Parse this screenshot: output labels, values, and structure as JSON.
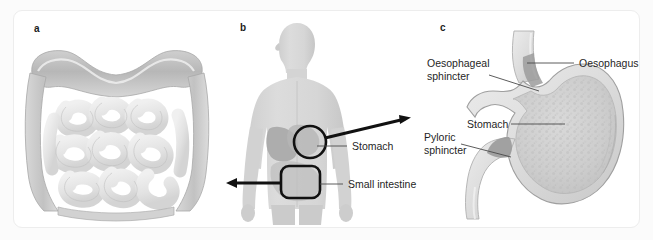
{
  "figure": {
    "panels": [
      {
        "letter": "a",
        "name": "intestines-illustration",
        "subject": "large and small intestine anatomical illustration",
        "labels": []
      },
      {
        "letter": "b",
        "name": "human-body-silhouette",
        "subject": "human body outline with digestive organ callouts",
        "labels": [
          {
            "text": "Stomach",
            "callout": "circle"
          },
          {
            "text": "Small intestine",
            "callout": "rounded-rectangle"
          }
        ]
      },
      {
        "letter": "c",
        "name": "stomach-cross-section",
        "subject": "stomach cross-section with sphincters",
        "labels": [
          {
            "text": "Oesophagus"
          },
          {
            "text": "Oesophageal",
            "text2": "sphincter"
          },
          {
            "text": "Stomach"
          },
          {
            "text": "Pyloric",
            "text2": "sphincter"
          }
        ]
      }
    ]
  },
  "panel_a": {
    "letter": "a"
  },
  "panel_b": {
    "letter": "b",
    "stomach_label": "Stomach",
    "small_intestine_label": "Small intestine"
  },
  "panel_c": {
    "letter": "c",
    "oesophagus_label": "Oesophagus",
    "oesophageal_sphincter_label_line1": "Oesophageal",
    "oesophageal_sphincter_label_line2": "sphincter",
    "stomach_label": "Stomach",
    "pyloric_sphincter_label_line1": "Pyloric",
    "pyloric_sphincter_label_line2": "sphincter"
  },
  "colors": {
    "page_background": "#fbfbfb",
    "card_background": "#ffffff",
    "card_border": "#ededed",
    "text": "#1f1f1f",
    "letter": "#1c1c1c",
    "callout_stroke": "#111111",
    "leader_stroke": "#4a4a4a",
    "organ_light": "#e6e6e6",
    "organ_mid": "#c9c9c9",
    "organ_dark": "#9a9a9a",
    "body_fill": "#d8d8d8"
  }
}
